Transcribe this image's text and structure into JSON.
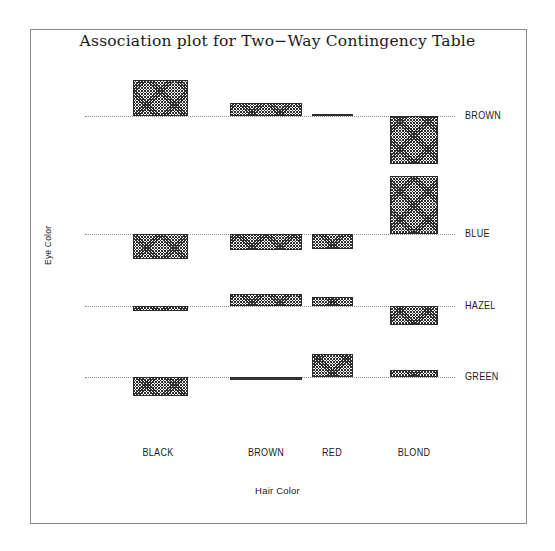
{
  "window": {
    "background_color": "#ffffff",
    "frame_color": "#8a8a8a"
  },
  "title": "Association plot for Two−Way Contingency Table",
  "axis": {
    "xlabel": "Hair Color",
    "ylabel": "Eye Color"
  },
  "row_labels": [
    "BROWN",
    "BLUE",
    "HAZEL",
    "GREEN"
  ],
  "col_labels": [
    "BLACK",
    "BROWN",
    "RED",
    "BLOND"
  ],
  "chart_data": {
    "type": "bar",
    "subtype": "association-plot",
    "title": "Association plot for Two−Way Contingency Table",
    "xlabel": "Hair Color",
    "ylabel": "Eye Color",
    "grid": false,
    "legend": "none",
    "columns": [
      "BLACK",
      "BROWN",
      "RED",
      "BLOND"
    ],
    "rows": [
      "BROWN",
      "BLUE",
      "HAZEL",
      "GREEN"
    ],
    "observed_counts": [
      [
        68,
        119,
        26,
        7
      ],
      [
        20,
        84,
        17,
        94
      ],
      [
        15,
        54,
        14,
        10
      ],
      [
        5,
        29,
        14,
        16
      ]
    ],
    "pearson_residuals": [
      [
        4.4,
        1.2,
        0.1,
        -5.9
      ],
      [
        -3.1,
        -1.9,
        -1.0,
        7.0
      ],
      [
        -0.5,
        1.4,
        0.9,
        -2.2
      ],
      [
        -1.9,
        -0.3,
        2.0,
        0.6
      ]
    ],
    "bar_widths_relative": [
      [
        0.21,
        0.3,
        0.17,
        0.19
      ],
      [
        0.21,
        0.3,
        0.17,
        0.19
      ],
      [
        0.21,
        0.3,
        0.17,
        0.19
      ],
      [
        0.21,
        0.3,
        0.17,
        0.19
      ]
    ],
    "note": "Bar height is proportional to the Pearson residual (signed, above/below the dotted baseline); bar width is proportional to the square root of the expected count."
  },
  "bars": [
    {
      "row": "BROWN",
      "col": "BLACK",
      "direction": "up",
      "x": 48,
      "width": 55,
      "height": 36,
      "thin": false
    },
    {
      "row": "BROWN",
      "col": "BROWN",
      "direction": "up",
      "x": 145,
      "width": 72,
      "height": 13,
      "thin": false
    },
    {
      "row": "BROWN",
      "col": "RED",
      "direction": "up",
      "x": 227,
      "width": 41,
      "height": 2,
      "thin": true
    },
    {
      "row": "BROWN",
      "col": "BLOND",
      "direction": "down",
      "x": 305,
      "width": 48,
      "height": 48,
      "thin": false
    },
    {
      "row": "BLUE",
      "col": "BLACK",
      "direction": "down",
      "x": 48,
      "width": 55,
      "height": 25,
      "thin": false
    },
    {
      "row": "BLUE",
      "col": "BROWN",
      "direction": "down",
      "x": 145,
      "width": 72,
      "height": 16,
      "thin": false
    },
    {
      "row": "BLUE",
      "col": "RED",
      "direction": "down",
      "x": 227,
      "width": 41,
      "height": 15,
      "thin": false
    },
    {
      "row": "BLUE",
      "col": "BLOND",
      "direction": "up",
      "x": 305,
      "width": 48,
      "height": 58,
      "thin": false
    },
    {
      "row": "HAZEL",
      "col": "BLACK",
      "direction": "down",
      "x": 48,
      "width": 55,
      "height": 5,
      "thin": false
    },
    {
      "row": "HAZEL",
      "col": "BROWN",
      "direction": "up",
      "x": 145,
      "width": 72,
      "height": 12,
      "thin": false
    },
    {
      "row": "HAZEL",
      "col": "RED",
      "direction": "up",
      "x": 227,
      "width": 41,
      "height": 9,
      "thin": false
    },
    {
      "row": "HAZEL",
      "col": "BLOND",
      "direction": "down",
      "x": 305,
      "width": 48,
      "height": 19,
      "thin": false
    },
    {
      "row": "GREEN",
      "col": "BLACK",
      "direction": "down",
      "x": 48,
      "width": 55,
      "height": 19,
      "thin": false
    },
    {
      "row": "GREEN",
      "col": "BROWN",
      "direction": "down",
      "x": 145,
      "width": 72,
      "height": 3,
      "thin": true
    },
    {
      "row": "GREEN",
      "col": "RED",
      "direction": "up",
      "x": 227,
      "width": 41,
      "height": 23,
      "thin": false
    },
    {
      "row": "GREEN",
      "col": "BLOND",
      "direction": "up",
      "x": 305,
      "width": 48,
      "height": 7,
      "thin": false
    }
  ],
  "layout": {
    "row_baseline_y": [
      56,
      174,
      246,
      317
    ],
    "col_center_x": [
      158,
      266,
      332,
      414
    ],
    "row_label_x": 465
  }
}
